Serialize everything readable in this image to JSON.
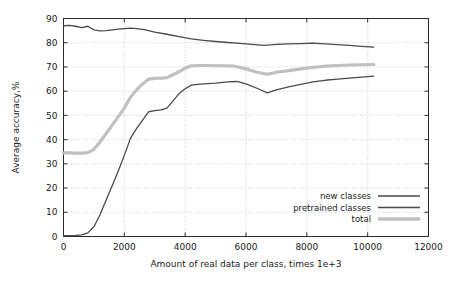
{
  "chart_data": {
    "type": "line",
    "title": "",
    "xlabel": "Amount of real data per class, times 1e+3",
    "ylabel": "Average accuracy,%",
    "xlim": [
      0,
      12000
    ],
    "ylim": [
      0,
      90
    ],
    "xticks": [
      0,
      2000,
      4000,
      6000,
      8000,
      10000,
      12000
    ],
    "xtick_labels": [
      "0",
      "2000",
      "4000",
      "6000",
      "8000",
      "10000",
      "12000"
    ],
    "yticks": [
      0,
      10,
      20,
      30,
      40,
      50,
      60,
      70,
      80,
      90
    ],
    "ytick_labels": [
      "0",
      "10",
      "20",
      "30",
      "40",
      "50",
      "60",
      "70",
      "80",
      "90"
    ],
    "grid": true,
    "grid_style": "dotted",
    "legend_position": "lower right",
    "series": [
      {
        "name": "new classes",
        "color": "#4a4a4a",
        "width": 1.3,
        "x": [
          0,
          200,
          400,
          600,
          800,
          1000,
          1200,
          1400,
          1600,
          1800,
          2000,
          2200,
          2400,
          2600,
          2800,
          3000,
          3200,
          3400,
          3600,
          3800,
          4000,
          4200,
          4400,
          4600,
          5000,
          5400,
          5700,
          6000,
          6400,
          6700,
          7000,
          7400,
          7800,
          8200,
          8600,
          9000,
          9400,
          9800,
          10200
        ],
        "values": [
          0.3,
          0.4,
          0.5,
          0.7,
          1.5,
          4.0,
          9.0,
          15.0,
          21.0,
          27.0,
          33.5,
          40.5,
          44.5,
          48.0,
          51.5,
          52.0,
          52.3,
          53.0,
          56.0,
          59.0,
          61.0,
          62.5,
          62.8,
          63.0,
          63.3,
          63.8,
          64.0,
          63.0,
          61.0,
          59.3,
          60.5,
          61.8,
          62.8,
          63.8,
          64.5,
          65.0,
          65.4,
          65.8,
          66.2
        ]
      },
      {
        "name": "pretrained classes",
        "color": "#4a4a4a",
        "width": 1.3,
        "x": [
          0,
          200,
          400,
          600,
          800,
          1000,
          1200,
          1400,
          1600,
          1800,
          2000,
          2200,
          2400,
          2600,
          2800,
          3000,
          3400,
          3800,
          4200,
          4600,
          5000,
          5400,
          5800,
          6200,
          6600,
          7000,
          7400,
          7800,
          8200,
          8600,
          9000,
          9400,
          9800,
          10200
        ],
        "values": [
          87.0,
          87.2,
          86.8,
          86.2,
          86.8,
          85.3,
          84.9,
          85.0,
          85.3,
          85.6,
          85.8,
          86.0,
          85.8,
          85.5,
          85.0,
          84.4,
          83.5,
          82.5,
          81.6,
          81.0,
          80.5,
          80.1,
          79.7,
          79.3,
          78.9,
          79.3,
          79.5,
          79.6,
          79.8,
          79.5,
          79.2,
          78.9,
          78.5,
          78.2
        ]
      },
      {
        "name": "total",
        "color": "#c0c0c0",
        "width": 3.2,
        "x": [
          0,
          200,
          400,
          600,
          800,
          1000,
          1200,
          1400,
          1600,
          1800,
          2000,
          2200,
          2400,
          2600,
          2800,
          3000,
          3200,
          3400,
          3600,
          3800,
          4000,
          4200,
          4400,
          4800,
          5200,
          5600,
          6000,
          6300,
          6700,
          7000,
          7400,
          7800,
          8200,
          8600,
          9000,
          9400,
          9800,
          10200
        ],
        "values": [
          34.5,
          34.5,
          34.4,
          34.4,
          34.6,
          36.0,
          39.0,
          42.5,
          46.0,
          49.5,
          53.0,
          57.5,
          60.5,
          63.0,
          65.0,
          65.3,
          65.4,
          65.6,
          66.8,
          68.0,
          69.5,
          70.5,
          70.6,
          70.6,
          70.5,
          70.4,
          69.2,
          68.0,
          67.0,
          67.8,
          68.5,
          69.2,
          69.8,
          70.3,
          70.6,
          70.8,
          70.9,
          71.0
        ]
      }
    ]
  },
  "legend": {
    "entries": [
      {
        "label": "new classes",
        "color": "#4a4a4a",
        "width": 1.6
      },
      {
        "label": "pretrained classes",
        "color": "#4a4a4a",
        "width": 1.6
      },
      {
        "label": "total",
        "color": "#c0c0c0",
        "width": 3.4
      }
    ]
  }
}
